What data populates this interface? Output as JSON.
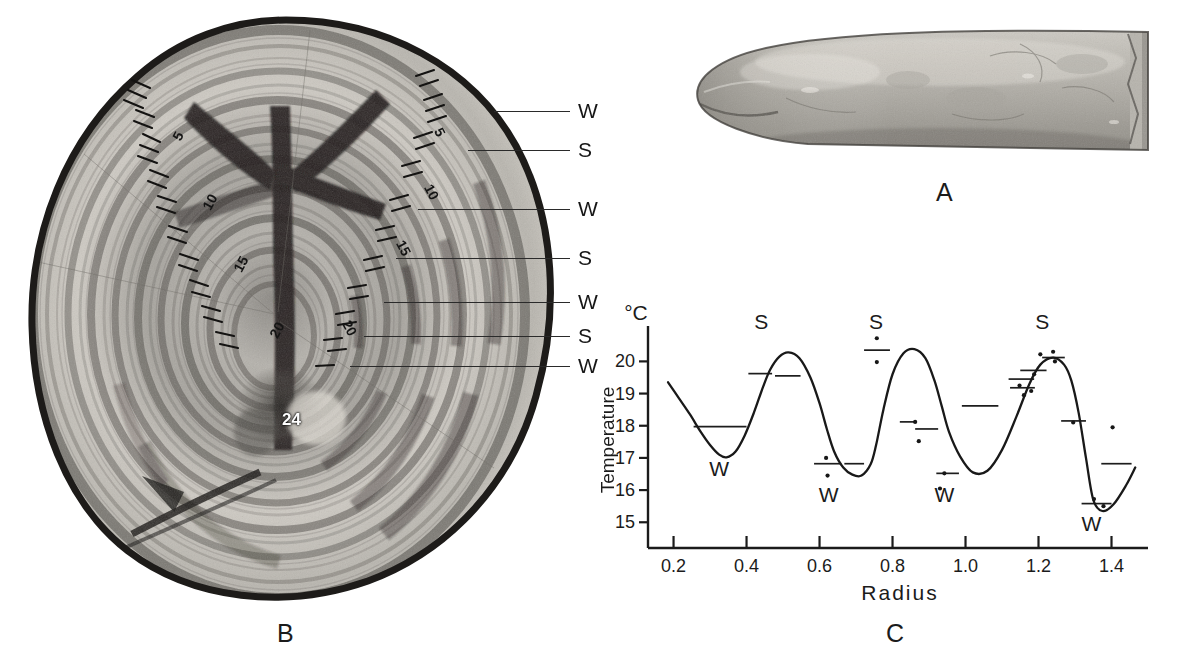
{
  "figure": {
    "panels": [
      {
        "id": "A",
        "letter": "A",
        "caption_x": 936,
        "caption_y": 178,
        "description": "whole otolith, elongated conical specimen, lateral view"
      },
      {
        "id": "B",
        "letter": "B",
        "caption_x": 277,
        "caption_y": 619,
        "description": "transverse section of otolith showing concentric annual growth rings"
      },
      {
        "id": "C",
        "letter": "C",
        "caption_x": 886,
        "caption_y": 619,
        "description": "temperature versus radius profile measured across the otolith section"
      }
    ]
  },
  "panelB": {
    "ring_numbers_left": [
      {
        "text": "5",
        "x": 150,
        "y": 122
      },
      {
        "text": "10",
        "x": 182,
        "y": 188
      },
      {
        "text": "15",
        "x": 213,
        "y": 249
      },
      {
        "text": "20",
        "x": 249,
        "y": 315
      }
    ],
    "ring_numbers_right": [
      {
        "text": "5",
        "x": 425,
        "y": 118
      },
      {
        "text": "10",
        "x": 419,
        "y": 178
      },
      {
        "text": "15",
        "x": 398,
        "y": 232
      },
      {
        "text": "20",
        "x": 333,
        "y": 312
      }
    ],
    "ring_numbers_center": [
      {
        "text": "24",
        "x": 287,
        "y": 406
      }
    ],
    "season_labels": [
      {
        "text": "W",
        "y": 112,
        "leader_x1": 470,
        "leader_x2": 548
      },
      {
        "text": "S",
        "y": 150,
        "leader_x1": 455,
        "leader_x2": 548
      },
      {
        "text": "S",
        "y": 150,
        "hidden": true
      },
      {
        "text": "W",
        "y": 210,
        "leader_x1": 418,
        "leader_x2": 548
      },
      {
        "text": "S",
        "y": 259,
        "leader_x1": 400,
        "leader_x2": 548
      },
      {
        "text": "W",
        "y": 303,
        "leader_x1": 388,
        "leader_x2": 548
      },
      {
        "text": "S",
        "y": 337,
        "leader_x1": 370,
        "leader_x2": 548
      },
      {
        "text": "W",
        "y": 367,
        "leader_x1": 355,
        "leader_x2": 548
      }
    ],
    "label_column_x": 556
  },
  "chart_data": {
    "type": "line",
    "title": "",
    "xlabel": "Radius",
    "ylabel": "Temperature",
    "y_unit_label": "°C",
    "xlim": [
      0.13,
      1.5
    ],
    "ylim": [
      14.2,
      21.1
    ],
    "xticks": [
      0.2,
      0.4,
      0.6,
      0.8,
      1.0,
      1.2,
      1.4
    ],
    "xtick_labels": [
      "0.2",
      "0.4",
      "0.6",
      "0.8",
      "1.0",
      "1.2",
      "1.4"
    ],
    "yticks": [
      15,
      16,
      17,
      18,
      19,
      20
    ],
    "ytick_labels": [
      "15",
      "16",
      "17",
      "18",
      "19",
      "20"
    ],
    "grid": false,
    "legend": null,
    "series": [
      {
        "name": "Temperature profile",
        "x": [
          0.185,
          0.215,
          0.245,
          0.275,
          0.3,
          0.325,
          0.345,
          0.37,
          0.395,
          0.42,
          0.445,
          0.465,
          0.49,
          0.515,
          0.545,
          0.575,
          0.6,
          0.62,
          0.64,
          0.665,
          0.69,
          0.715,
          0.74,
          0.755,
          0.775,
          0.8,
          0.83,
          0.86,
          0.89,
          0.915,
          0.935,
          0.955,
          0.985,
          1.02,
          1.06,
          1.1,
          1.14,
          1.175,
          1.205,
          1.24,
          1.27,
          1.29,
          1.31,
          1.33,
          1.35,
          1.375,
          1.405,
          1.44,
          1.465
        ],
        "y": [
          19.35,
          18.85,
          18.35,
          17.8,
          17.4,
          17.1,
          17.02,
          17.2,
          17.7,
          18.4,
          19.2,
          19.75,
          20.15,
          20.28,
          20.1,
          19.5,
          18.7,
          17.9,
          17.2,
          16.7,
          16.48,
          16.45,
          16.8,
          17.4,
          18.5,
          19.6,
          20.25,
          20.38,
          20.1,
          19.4,
          18.6,
          17.8,
          17.05,
          16.55,
          16.6,
          17.25,
          18.3,
          19.3,
          19.9,
          20.12,
          19.9,
          19.4,
          18.4,
          17.0,
          15.7,
          15.35,
          15.55,
          16.15,
          16.7
        ]
      }
    ],
    "scatter_points": [
      {
        "x": 0.618,
        "y": 17.0
      },
      {
        "x": 0.757,
        "y": 20.72
      },
      {
        "x": 0.757,
        "y": 19.98
      },
      {
        "x": 0.622,
        "y": 16.45
      },
      {
        "x": 0.862,
        "y": 18.12
      },
      {
        "x": 0.872,
        "y": 17.52
      },
      {
        "x": 0.942,
        "y": 16.52
      },
      {
        "x": 1.148,
        "y": 19.25
      },
      {
        "x": 1.16,
        "y": 18.95
      },
      {
        "x": 1.18,
        "y": 19.08
      },
      {
        "x": 1.205,
        "y": 20.22
      },
      {
        "x": 1.24,
        "y": 20.3
      },
      {
        "x": 1.245,
        "y": 20.0
      },
      {
        "x": 1.188,
        "y": 19.6
      },
      {
        "x": 1.295,
        "y": 18.1
      },
      {
        "x": 1.352,
        "y": 15.72
      },
      {
        "x": 1.378,
        "y": 15.5
      },
      {
        "x": 1.403,
        "y": 17.95
      },
      {
        "x": 0.93,
        "y": 16.05
      }
    ],
    "mean_bars": [
      {
        "x1": 0.255,
        "x2": 0.4,
        "y": 17.97
      },
      {
        "x1": 0.405,
        "x2": 0.47,
        "y": 19.62
      },
      {
        "x1": 0.478,
        "x2": 0.548,
        "y": 19.55
      },
      {
        "x1": 0.585,
        "x2": 0.66,
        "y": 16.82
      },
      {
        "x1": 0.668,
        "x2": 0.722,
        "y": 16.82
      },
      {
        "x1": 0.722,
        "x2": 0.793,
        "y": 20.35
      },
      {
        "x1": 0.82,
        "x2": 0.862,
        "y": 18.12
      },
      {
        "x1": 0.862,
        "x2": 0.925,
        "y": 17.9
      },
      {
        "x1": 0.92,
        "x2": 0.982,
        "y": 16.52
      },
      {
        "x1": 0.99,
        "x2": 1.09,
        "y": 18.62
      },
      {
        "x1": 1.118,
        "x2": 1.188,
        "y": 19.45
      },
      {
        "x1": 1.122,
        "x2": 1.19,
        "y": 19.18
      },
      {
        "x1": 1.15,
        "x2": 1.222,
        "y": 19.72
      },
      {
        "x1": 1.21,
        "x2": 1.272,
        "y": 20.12
      },
      {
        "x1": 1.262,
        "x2": 1.33,
        "y": 18.15
      },
      {
        "x1": 1.318,
        "x2": 1.4,
        "y": 15.58
      },
      {
        "x1": 1.372,
        "x2": 1.455,
        "y": 16.82
      }
    ],
    "annotations": [
      {
        "text": "S",
        "x": 0.44,
        "y": 21.0,
        "role": "summer-band"
      },
      {
        "text": "S",
        "x": 0.755,
        "y": 21.0,
        "role": "summer-band"
      },
      {
        "text": "S",
        "x": 1.21,
        "y": 21.0,
        "role": "summer-band"
      },
      {
        "text": "W",
        "x": 0.325,
        "y": 16.45,
        "role": "winter-band"
      },
      {
        "text": "W",
        "x": 0.625,
        "y": 15.62,
        "role": "winter-band"
      },
      {
        "text": "W",
        "x": 0.942,
        "y": 15.62,
        "role": "winter-band"
      },
      {
        "text": "W",
        "x": 1.345,
        "y": 14.72,
        "role": "winter-band"
      }
    ]
  }
}
